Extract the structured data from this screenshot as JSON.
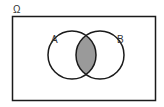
{
  "diagram": {
    "type": "venn",
    "universe_label": "Ω",
    "sets": [
      {
        "label": "A",
        "cx": 72,
        "cy": 55,
        "r": 24
      },
      {
        "label": "B",
        "cx": 100,
        "cy": 55,
        "r": 24
      }
    ],
    "shaded_region": "A ∩ B",
    "colors": {
      "stroke": "#1a1a1a",
      "shade": "#9a9a9a",
      "background": "#ffffff"
    }
  }
}
